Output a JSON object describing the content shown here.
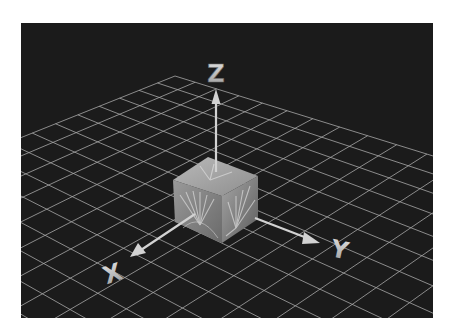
{
  "scene": {
    "description": "3D rendered coordinate axes with textured cube on perspective grid",
    "background_color": "#ffffff",
    "viewport_color": "#1b1b1b",
    "grid_color": "#a8a8a8",
    "axis_color": "#cfcfcf",
    "cube_color": "#8a8a8a"
  },
  "axes": {
    "x": {
      "label": "X"
    },
    "y": {
      "label": "Y"
    },
    "z": {
      "label": "Z"
    }
  }
}
